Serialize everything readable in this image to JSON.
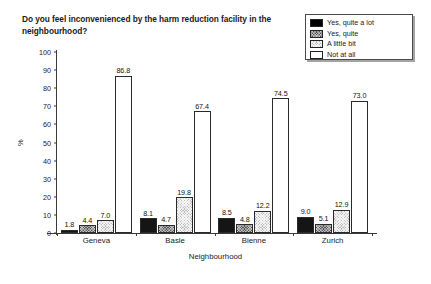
{
  "chart_data": {
    "type": "bar",
    "title": "Do you feel inconvenienced by the harm reduction facility in the neighbourhood?",
    "xlabel": "Neighbourhood",
    "ylabel": "%",
    "ylim": [
      0,
      100
    ],
    "ytick_step": 10,
    "grid": false,
    "legend_position": "top-right",
    "categories": [
      "Geneva",
      "Basle",
      "Bienne",
      "Zurich"
    ],
    "yticks": [
      "0",
      "10",
      "20",
      "30",
      "40",
      "50",
      "60",
      "70",
      "80",
      "90",
      "100"
    ],
    "series": [
      {
        "name": "Yes, quite a lot",
        "color": "#151515",
        "values": [
          1.8,
          8.1,
          8.5,
          9.0
        ],
        "labels": [
          "1.8",
          "8.1",
          "8.5",
          "9.0"
        ]
      },
      {
        "name": "Yes, quite",
        "color": "#575757",
        "values": [
          4.4,
          4.7,
          4.8,
          5.1
        ],
        "labels": [
          "4.4",
          "4.7",
          "4.8",
          "5.1"
        ]
      },
      {
        "name": "A little bit",
        "color": "#bdbdbd",
        "values": [
          7.0,
          19.8,
          12.2,
          12.9
        ],
        "labels": [
          "7.0",
          "19.8",
          "12.2",
          "12.9"
        ]
      },
      {
        "name": "Not at all",
        "color": "#ffffff",
        "values": [
          86.8,
          67.4,
          74.5,
          73.0
        ],
        "labels": [
          "86.8",
          "67.4",
          "74.5",
          "73.0"
        ]
      }
    ]
  }
}
